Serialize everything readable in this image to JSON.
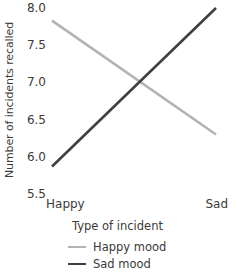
{
  "chart_data": {
    "type": "line",
    "title": "",
    "xlabel": "Type of incident",
    "ylabel": "Number of incidents recalled",
    "categories": [
      "Happy",
      "Sad"
    ],
    "x": [
      0,
      1
    ],
    "xlim": [
      0,
      1
    ],
    "ylim": [
      5.5,
      8.0
    ],
    "yticks": [
      8.0,
      7.5,
      7.0,
      6.5,
      6.0,
      5.5
    ],
    "ytick_labels": [
      "8.0",
      "7.5",
      "7.0",
      "6.5",
      "6.0",
      "5.5"
    ],
    "grid": false,
    "legend_position": "bottom",
    "series": [
      {
        "name": "Happy mood",
        "values": [
          7.83,
          6.3
        ],
        "color": "#b3b3b3",
        "line_width": 2.6
      },
      {
        "name": "Sad mood",
        "values": [
          5.87,
          8.0
        ],
        "color": "#404040",
        "line_width": 2.6
      }
    ],
    "annotations": []
  },
  "axes": {
    "y_title": "Number of incidents recalled",
    "x_title": "Type of incident",
    "y_tick_labels": [
      "8.0",
      "7.5",
      "7.0",
      "6.5",
      "6.0",
      "5.5"
    ],
    "x_tick_labels": [
      "Happy",
      "Sad"
    ]
  },
  "legend": {
    "entries": [
      {
        "label": "Happy mood",
        "color": "#b3b3b3"
      },
      {
        "label": "Sad mood",
        "color": "#404040"
      }
    ]
  },
  "colors": {
    "background": "#ffffff",
    "text": "#3a3a3a",
    "happy_mood_line": "#b3b3b3",
    "sad_mood_line": "#404040"
  }
}
